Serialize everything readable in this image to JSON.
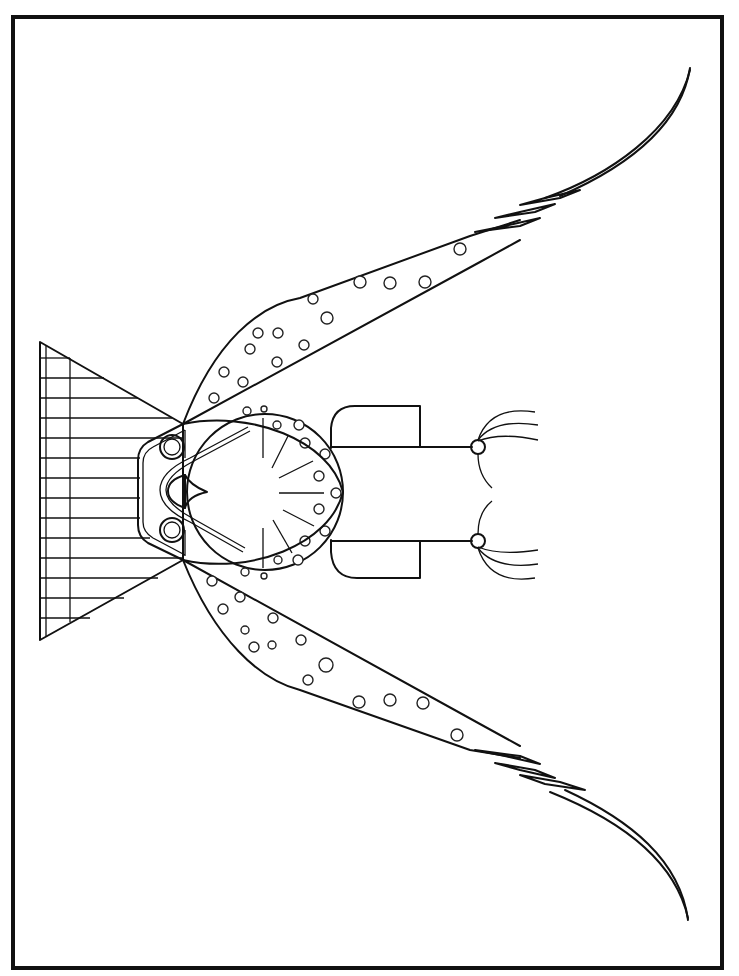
{
  "page": {
    "type": "coloring page",
    "colors": {
      "line": "#111111",
      "background": "#ffffff"
    }
  },
  "frame": {
    "x": 13,
    "y": 17,
    "width": 709,
    "height": 951
  },
  "parts": {
    "tail_fan": {
      "label": "striped triangular tail fan",
      "stripes": 14
    },
    "head": {
      "label": "rounded head with two eyes and beak",
      "eyes": 2
    },
    "body_disc": {
      "label": "spotted circular breast"
    },
    "wings": {
      "label": "two long spotted wings ending in striped feather tips",
      "count": 2
    },
    "legs": {
      "label": "two legs with curved talons",
      "count": 2
    }
  }
}
